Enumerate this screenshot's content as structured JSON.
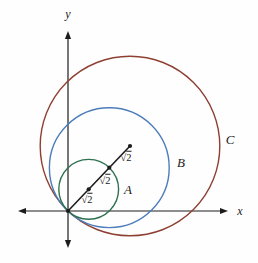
{
  "canvas": {
    "width": 258,
    "height": 263,
    "background": "#fefefe",
    "ink_color": "#1c1c1c"
  },
  "axes": {
    "color": "#1c1c1c",
    "origin": {
      "x": 68,
      "y": 211
    },
    "x_axis": {
      "tip_left": 18,
      "tip_right": 228,
      "y": 211,
      "label": "x",
      "label_x": 240,
      "label_y": 211
    },
    "y_axis": {
      "tip_top": 31,
      "tip_bottom": 248,
      "x": 68,
      "label": "y",
      "label_x": 68,
      "label_y": 14
    }
  },
  "circles": [
    {
      "id": "A",
      "label": "A",
      "cx": 88.7,
      "cy": 189.3,
      "r": 29.9,
      "color": "#2d7150",
      "label_x": 128,
      "label_y": 189
    },
    {
      "id": "B",
      "label": "B",
      "cx": 109.3,
      "cy": 167.7,
      "r": 59.9,
      "color": "#4d7cba",
      "label_x": 181,
      "label_y": 162
    },
    {
      "id": "C",
      "label": "C",
      "cx": 130,
      "cy": 146,
      "r": 89.8,
      "color": "#8e4033",
      "label_x": 230,
      "label_y": 139
    }
  ],
  "radius_line": {
    "color": "#1c1c1c",
    "from": {
      "x": 68,
      "y": 211
    },
    "to": {
      "x": 130,
      "y": 146
    },
    "points": [
      {
        "x": 68,
        "y": 211
      },
      {
        "x": 88.7,
        "y": 189.3
      },
      {
        "x": 109.3,
        "y": 167.7
      },
      {
        "x": 130,
        "y": 146
      }
    ],
    "segment_labels": [
      {
        "text": "√2",
        "x": 87,
        "y": 200
      },
      {
        "text": "√2",
        "x": 105,
        "y": 181
      },
      {
        "text": "√2",
        "x": 126,
        "y": 158
      }
    ]
  }
}
